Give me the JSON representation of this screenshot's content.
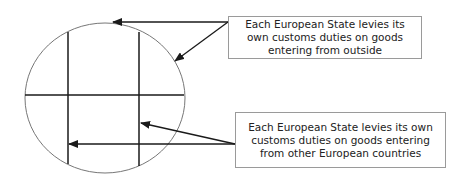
{
  "diagram": {
    "callouts": [
      {
        "id": "external-duties",
        "text": "Each European State levies its own customs duties on goods entering from outside"
      },
      {
        "id": "internal-duties",
        "text": "Each European State levies its own customs duties on goods entering from other European countries"
      }
    ],
    "colors": {
      "lines": "#1a1a1a",
      "circle": "#777777",
      "box_border": "#9a9a9a",
      "text": "#222222"
    }
  }
}
